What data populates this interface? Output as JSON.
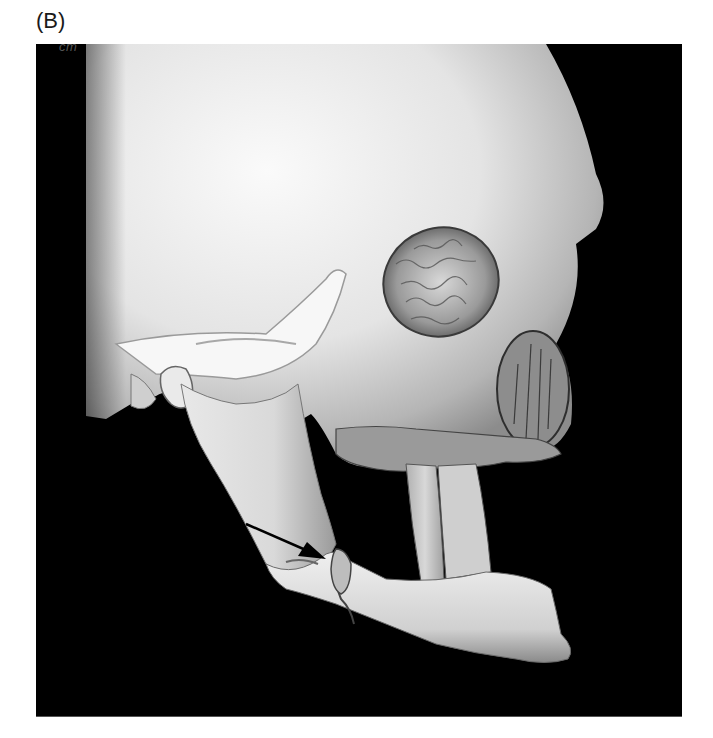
{
  "figure": {
    "panel_label": "(B)",
    "scale_label": "cm",
    "annotation": {
      "type": "arrow",
      "target": "mandible fracture",
      "color": "#000000"
    },
    "colors": {
      "background": "#000000",
      "bone_light": "#f2f2f2",
      "bone_mid": "#c8c8c8",
      "bone_shadow": "#8a8a8a",
      "page": "#ffffff"
    }
  }
}
